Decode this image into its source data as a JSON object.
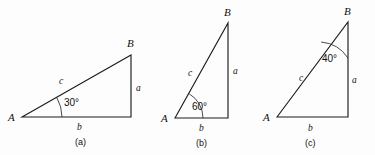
{
  "figure": {
    "background_color": "#fdfdfd",
    "line_color": "#1c1c1c",
    "text_color": "#111111",
    "panels": [
      {
        "caption": "(a)",
        "vertex_a_label": "A",
        "vertex_b_label": "B",
        "side_a_label": "a",
        "side_b_label": "b",
        "side_c_label": "c",
        "angle_label": "30°",
        "angle_value": 30,
        "angle_at": "A",
        "right_angle_at": "C"
      },
      {
        "caption": "(b)",
        "vertex_a_label": "A",
        "vertex_b_label": "B",
        "side_a_label": "a",
        "side_b_label": "b",
        "side_c_label": "c",
        "angle_label": "60°",
        "angle_value": 60,
        "angle_at": "A",
        "right_angle_at": "C"
      },
      {
        "caption": "(c)",
        "vertex_a_label": "A",
        "vertex_b_label": "B",
        "side_a_label": "a",
        "side_b_label": "b",
        "side_c_label": "c",
        "angle_label": "40°",
        "angle_value": 40,
        "angle_at": "B",
        "right_angle_at": "C"
      }
    ]
  }
}
